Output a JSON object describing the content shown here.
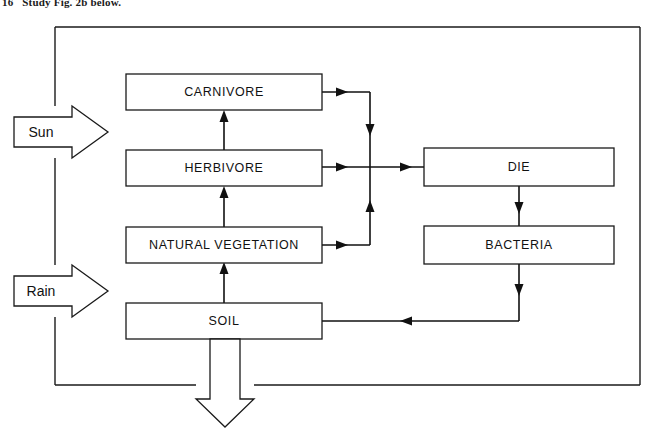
{
  "caption": {
    "text": "16   Study Fig. 2b below."
  },
  "diagram": {
    "frame": {
      "x": 55,
      "y": 27,
      "width": 585,
      "height": 358
    },
    "colors": {
      "stroke": "#1a1a1a",
      "line": "#111111",
      "fill": "#ffffff",
      "text": "#111111"
    },
    "nodes": [
      {
        "id": "carnivore",
        "label": "CARNIVORE",
        "x": 126,
        "y": 74,
        "width": 196,
        "height": 36
      },
      {
        "id": "herbivore",
        "label": "HERBIVORE",
        "x": 126,
        "y": 150,
        "width": 196,
        "height": 36
      },
      {
        "id": "natural_vegetation",
        "label": "NATURAL VEGETATION",
        "x": 126,
        "y": 227,
        "width": 196,
        "height": 36
      },
      {
        "id": "soil",
        "label": "SOIL",
        "x": 126,
        "y": 303,
        "width": 196,
        "height": 36
      },
      {
        "id": "die",
        "label": "DIE",
        "x": 424,
        "y": 148,
        "width": 190,
        "height": 38
      },
      {
        "id": "bacteria",
        "label": "BACTERIA",
        "x": 424,
        "y": 226,
        "width": 190,
        "height": 38
      }
    ],
    "input_arrows": [
      {
        "id": "sun",
        "label": "Sun",
        "x": 14,
        "y": 106,
        "width": 94,
        "height": 52
      },
      {
        "id": "rain",
        "label": "Rain",
        "x": 14,
        "y": 265,
        "width": 94,
        "height": 52
      }
    ],
    "output_arrow": {
      "id": "leaching-outflow",
      "label": "",
      "x": 196,
      "y": 339,
      "width": 58,
      "height": 88
    },
    "flows": [
      {
        "id": "soil-to-vegetation",
        "from": "soil",
        "to": "natural_vegetation",
        "direction": "up"
      },
      {
        "id": "vegetation-to-herbivore",
        "from": "natural_vegetation",
        "to": "herbivore",
        "direction": "up"
      },
      {
        "id": "herbivore-to-carnivore",
        "from": "herbivore",
        "to": "carnivore",
        "direction": "up"
      },
      {
        "id": "carnivore-to-die",
        "from": "carnivore",
        "to": "die",
        "direction": "right-down"
      },
      {
        "id": "herbivore-to-die",
        "from": "herbivore",
        "to": "die",
        "direction": "right"
      },
      {
        "id": "vegetation-to-die",
        "from": "natural_vegetation",
        "to": "die",
        "direction": "right-up"
      },
      {
        "id": "die-to-bacteria",
        "from": "die",
        "to": "bacteria",
        "direction": "down"
      },
      {
        "id": "bacteria-to-soil",
        "from": "bacteria",
        "to": "soil",
        "direction": "down-left"
      },
      {
        "id": "soil-outflow",
        "from": "soil",
        "to": "outside",
        "direction": "down"
      }
    ]
  }
}
